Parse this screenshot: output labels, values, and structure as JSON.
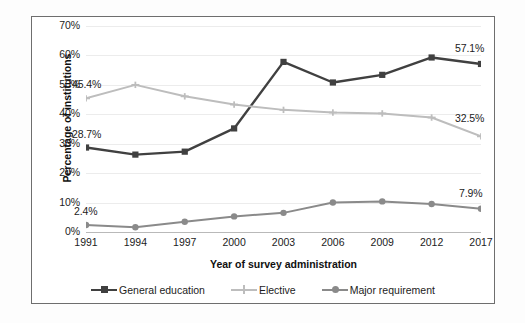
{
  "chart_data": {
    "type": "line",
    "title": "",
    "xlabel": "Year of survey administration",
    "ylabel": "Percentage of institutions",
    "categories": [
      "1991",
      "1994",
      "1997",
      "2000",
      "2003",
      "2006",
      "2009",
      "2012",
      "2017"
    ],
    "ylim": [
      0,
      70
    ],
    "ytick_labels": [
      "0%",
      "10%",
      "20%",
      "30%",
      "40%",
      "50%",
      "60%",
      "70%"
    ],
    "ytick_values": [
      0,
      10,
      20,
      30,
      40,
      50,
      60,
      70
    ],
    "grid": true,
    "legend_position": "bottom",
    "series": [
      {
        "name": "General education",
        "color": "#404040",
        "marker": "square",
        "values": [
          28.7,
          26.3,
          27.3,
          35.2,
          57.8,
          50.8,
          53.4,
          59.3,
          57.1
        ]
      },
      {
        "name": "Elective",
        "color": "#bdbdbd",
        "marker": "plus",
        "values": [
          45.4,
          50.0,
          46.1,
          43.3,
          41.5,
          40.6,
          40.3,
          38.9,
          32.5
        ]
      },
      {
        "name": "Major requirement",
        "color": "#8a8a8a",
        "marker": "circle",
        "values": [
          2.4,
          1.6,
          3.5,
          5.3,
          6.5,
          10.0,
          10.4,
          9.5,
          7.9
        ]
      }
    ],
    "annotations": [
      {
        "text": "45.4%",
        "series": "Elective",
        "category": "1991"
      },
      {
        "text": "28.7%",
        "series": "General education",
        "category": "1991"
      },
      {
        "text": "2.4%",
        "series": "Major requirement",
        "category": "1991"
      },
      {
        "text": "57.1%",
        "series": "General education",
        "category": "2017"
      },
      {
        "text": "32.5%",
        "series": "Elective",
        "category": "2017"
      },
      {
        "text": "7.9%",
        "series": "Major requirement",
        "category": "2017"
      }
    ]
  },
  "legend": {
    "items": [
      {
        "label": "General education"
      },
      {
        "label": "Elective"
      },
      {
        "label": "Major requirement"
      }
    ]
  }
}
